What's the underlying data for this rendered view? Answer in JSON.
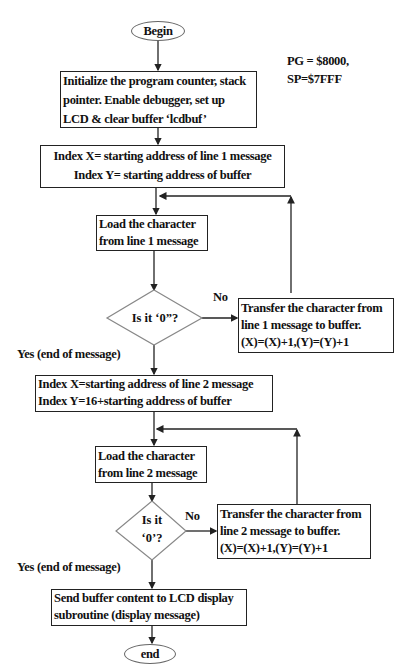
{
  "annotation": {
    "line1": "PG = $8000,",
    "line2": "SP=$7FFF"
  },
  "nodes": {
    "begin": "Begin",
    "init": {
      "lines": [
        "Initialize the program counter, stack",
        "pointer. Enable debugger, set up",
        "LCD & clear buffer ‘lcdbuf’"
      ]
    },
    "index1": {
      "lines": [
        "Index X= starting address of line 1 message",
        "Index Y= starting address of buffer"
      ]
    },
    "load1": {
      "lines": [
        "Load the character",
        "from line 1 message"
      ]
    },
    "decision1": {
      "lines": [
        "Is it ‘0”?"
      ]
    },
    "transfer1": {
      "lines": [
        "Transfer the character from",
        "line 1 message to buffer.",
        "(X)=(X)+1,(Y)=(Y)+1"
      ]
    },
    "index2": {
      "lines": [
        "Index X=starting address of line 2 message",
        "Index Y=16+starting address of buffer"
      ]
    },
    "load2": {
      "lines": [
        "Load the character",
        "from line 2 message"
      ]
    },
    "decision2": {
      "lines": [
        "Is it",
        "‘0’?"
      ]
    },
    "transfer2": {
      "lines": [
        "Transfer the character from",
        "line 2 message to buffer.",
        "(X)=(X)+1,(Y)=(Y)+1"
      ]
    },
    "send": {
      "lines": [
        "Send buffer content to LCD display",
        "subroutine (display message)"
      ]
    },
    "end": "end"
  },
  "edge_labels": {
    "no1": "No",
    "yes1": "Yes (end of message)",
    "no2": "No",
    "yes2": "Yes (end of message)"
  },
  "colors": {
    "line": "#222222",
    "oval_border": "#666666",
    "diamond_border": "#888888"
  }
}
